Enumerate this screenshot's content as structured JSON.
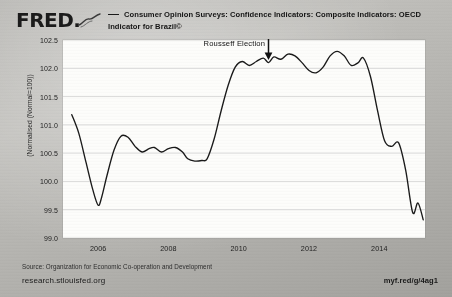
{
  "branding": {
    "logo_text": "FRED",
    "logo_mark": "line-chart-squiggle"
  },
  "legend": {
    "series_label": "Consumer Opinion Surveys: Confidence Indicators: Composite Indicators: OECD Indicator for Brazil©",
    "marker_color": "#1a1a1a"
  },
  "annotations": [
    {
      "label": "Rousseff Election",
      "marker": "down-arrow"
    }
  ],
  "footer": {
    "source": "Source: Organization for Economic Co-operation and Development",
    "site": "research.stlouisfed.org",
    "short_url": "myf.red/g/4ag1"
  },
  "chart_data": {
    "type": "line",
    "title": "",
    "subtitle": "",
    "xlabel": "",
    "ylabel": "(Normalised (Normal=100))",
    "ylim": [
      99.0,
      102.5
    ],
    "xlim": [
      2005.0,
      2015.3
    ],
    "yticks": [
      "102.5",
      "102.0",
      "101.5",
      "101.0",
      "100.5",
      "100.0",
      "99.5",
      "99.0"
    ],
    "ytick_values": [
      102.5,
      102.0,
      101.5,
      101.0,
      100.5,
      100.0,
      99.5,
      99.0
    ],
    "xticks": [
      "2006",
      "2008",
      "2010",
      "2012",
      "2014"
    ],
    "xtick_values": [
      2006,
      2008,
      2010,
      2012,
      2014
    ],
    "grid": "horizontal",
    "legend_position": "top",
    "line_color": "#1a1a1a",
    "plot_background": "#fdfdfb",
    "series": [
      {
        "name": "Consumer Opinion Surveys: Confidence Indicators: Composite Indicators: OECD Indicator for Brazil©",
        "x": [
          2005.25,
          2005.45,
          2005.65,
          2005.85,
          2006.0,
          2006.1,
          2006.25,
          2006.45,
          2006.65,
          2006.85,
          2007.05,
          2007.25,
          2007.45,
          2007.6,
          2007.8,
          2008.0,
          2008.2,
          2008.4,
          2008.55,
          2008.75,
          2008.95,
          2009.1,
          2009.3,
          2009.5,
          2009.7,
          2009.9,
          2010.1,
          2010.3,
          2010.5,
          2010.7,
          2010.85,
          2011.0,
          2011.2,
          2011.4,
          2011.6,
          2011.8,
          2012.0,
          2012.2,
          2012.4,
          2012.6,
          2012.8,
          2013.0,
          2013.2,
          2013.4,
          2013.55,
          2013.75,
          2013.95,
          2014.15,
          2014.35,
          2014.55,
          2014.75,
          2014.95,
          2015.1,
          2015.25
        ],
        "y": [
          101.18,
          100.85,
          100.35,
          99.85,
          99.58,
          99.72,
          100.1,
          100.55,
          100.8,
          100.78,
          100.62,
          100.52,
          100.58,
          100.6,
          100.52,
          100.58,
          100.6,
          100.52,
          100.4,
          100.36,
          100.37,
          100.4,
          100.75,
          101.25,
          101.7,
          102.02,
          102.12,
          102.05,
          102.12,
          102.18,
          102.1,
          102.2,
          102.16,
          102.25,
          102.22,
          102.1,
          101.96,
          101.92,
          102.02,
          102.22,
          102.3,
          102.22,
          102.05,
          102.1,
          102.18,
          101.85,
          101.25,
          100.72,
          100.62,
          100.68,
          100.2,
          99.45,
          99.62,
          99.32
        ]
      }
    ],
    "annotation_points": [
      {
        "label": "Rousseff Election",
        "x": 2010.85,
        "y": 102.1
      }
    ]
  }
}
